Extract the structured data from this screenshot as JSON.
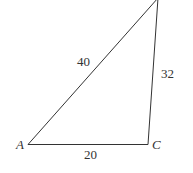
{
  "diagram": {
    "type": "triangle",
    "vertices": [
      {
        "label": "A"
      },
      {
        "label": "C"
      },
      {
        "label": ""
      }
    ],
    "sides": {
      "AC": "20",
      "AB": "40",
      "BC": "32"
    }
  }
}
